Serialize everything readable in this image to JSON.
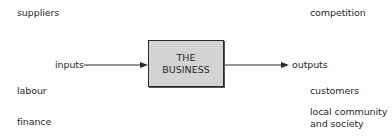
{
  "diagram": {
    "center": {
      "line1": "THE",
      "line2": "BUSINESS",
      "fill": "#d3d3d3"
    },
    "input_label": "inputs",
    "output_label": "outputs",
    "left_stakeholders": [
      "suppliers",
      "labour",
      "finance"
    ],
    "right_stakeholders": [
      "competition",
      "customers",
      "local community",
      "and society"
    ]
  }
}
